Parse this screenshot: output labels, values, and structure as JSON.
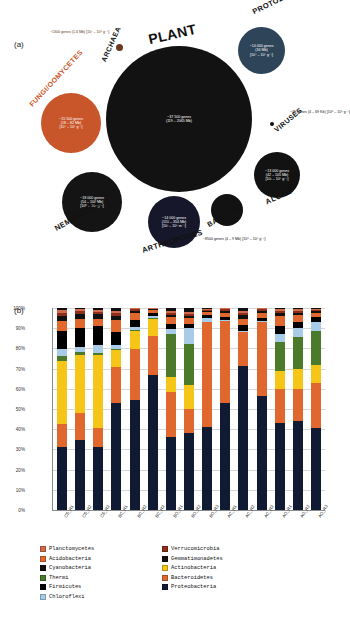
{
  "figure": {
    "panel_a_tag": "(a)",
    "panel_b_tag": "(b)"
  },
  "panel_a": {
    "groups": [
      {
        "name": "plant",
        "label": "PLANT",
        "genes": "~37 500 genes",
        "size": "(119 – 2065 Mb)",
        "abundance": "",
        "color": "#121212",
        "label_color": "#111111"
      },
      {
        "name": "fungi",
        "label": "FUNGI/OOMYCETES",
        "genes": "~15 500 genes",
        "size": "(18 – 82 Mb)",
        "abundance": "[10⁴ – 10⁶ g⁻¹]",
        "color": "#c9562a",
        "label_color": "#c9562a"
      },
      {
        "name": "protozoa",
        "label": "PROTOZOA",
        "genes": "~14 000 genes",
        "size": "(34 Mb)",
        "abundance": "[10⁴ – 10⁵ g⁻¹]",
        "color": "#2e4559",
        "label_color": "#111111"
      },
      {
        "name": "algae",
        "label": "ALGAE",
        "genes": "~13 000 genes",
        "size": "(42 – 105 Mb)",
        "abundance": "[10³ – 10⁶ g⁻¹]",
        "color": "#121212",
        "label_color": "#111111"
      },
      {
        "name": "nematodes",
        "label": "NEMATODES",
        "genes": "~18 000 genes",
        "size": "(54 – 100 Mb)",
        "abundance": "[10⁰ – 10² g⁻¹]",
        "color": "#141414",
        "label_color": "#111111"
      },
      {
        "name": "arthropodes",
        "label": "ARTHROPODES",
        "genes": "~14 000 genes",
        "size": "(151 – 354 Mb)",
        "abundance": "[10² – 10⁵ m⁻²]",
        "color": "#17172b",
        "label_color": "#111111"
      },
      {
        "name": "bacteria",
        "label": "BACTERIA",
        "genes": "~8500 genes",
        "size": "(4 – 9 Mb)",
        "abundance": "[10⁸ – 10⁹ g⁻¹]",
        "color": "#121212",
        "label_color": "#111111"
      },
      {
        "name": "archaea",
        "label": "ARCHAEA",
        "genes": "~1300 genes",
        "size": "(1.6 Mb)",
        "abundance": "[10⁷ – 10⁸ g⁻¹]",
        "color": "#6a3a1e",
        "label_color": "#111111"
      },
      {
        "name": "viruses",
        "label": "VIRUSES",
        "genes": "~45 genes",
        "size": "(4 – 69 Kb)",
        "abundance": "[10⁸ – 10⁹ g⁻¹]",
        "color": "#0d0d0d",
        "label_color": "#111111"
      }
    ]
  },
  "chart_data": {
    "type": "bar",
    "subtype": "stacked-percentage-column",
    "title": "",
    "xlabel": "",
    "ylabel": "Sequences",
    "ylim": [
      0,
      100
    ],
    "ytick_labels": [
      "0%",
      "10%",
      "20%",
      "30%",
      "40%",
      "50%",
      "60%",
      "70%",
      "80%",
      "90%",
      "100%"
    ],
    "grid": true,
    "legend_position": "bottom",
    "categories": [
      "CS_R1",
      "CS_R2",
      "CS_R3",
      "BC_R1",
      "BC_R2",
      "BC_R3",
      "BO_R1",
      "BO_R2",
      "BO_R3",
      "AC_R1",
      "AC_R2",
      "AC_R3",
      "AO_R1",
      "AO_R2",
      "AO_R3"
    ],
    "series": [
      {
        "name": "Proteobacteria",
        "color": "#111a33",
        "values": [
          31,
          34.5,
          31,
          53,
          54.5,
          67,
          36,
          38,
          41,
          53,
          71.5,
          56.5,
          43,
          44,
          41
        ]
      },
      {
        "name": "Bacteroidetes",
        "color": "#e0682f",
        "values": [
          11.5,
          13.5,
          9.5,
          18,
          25,
          19,
          22.5,
          12,
          52,
          40.5,
          16.5,
          36.5,
          17,
          16,
          22
        ]
      },
      {
        "name": "Actinobacteria",
        "color": "#f5c518",
        "values": [
          31.5,
          28.5,
          36,
          8,
          9,
          8.5,
          7.5,
          12,
          0,
          0,
          0,
          0,
          9,
          10,
          9
        ]
      },
      {
        "name": "Thermi",
        "color": "#4a7a2a",
        "values": [
          2.5,
          1.5,
          1,
          0.5,
          0.5,
          0.5,
          21,
          20,
          0,
          0,
          0,
          0,
          14,
          15.5,
          17
        ]
      },
      {
        "name": "Chloroflexi",
        "color": "#a8cbe8",
        "values": [
          3,
          2.5,
          4,
          2,
          1.5,
          1,
          2.5,
          8,
          2,
          0.5,
          0.5,
          0.5,
          4,
          4.5,
          4.5
        ]
      },
      {
        "name": "Firmicutes",
        "color": "#000000",
        "values": [
          9,
          9.5,
          9.5,
          6.5,
          3.5,
          1.5,
          2.5,
          2,
          1.5,
          1.5,
          3,
          1.5,
          4,
          3,
          2.5
        ]
      },
      {
        "name": "Acidobacteria",
        "color": "#e0682f",
        "values": [
          5,
          4.5,
          3.5,
          6,
          3.5,
          1.5,
          3.5,
          3,
          1.5,
          2,
          3,
          2.5,
          5,
          3.5,
          2
        ]
      },
      {
        "name": "Gemmatimonadetes",
        "color": "#111111",
        "values": [
          2.5,
          2.5,
          2.5,
          2,
          1,
          0.5,
          1,
          1,
          0.5,
          1,
          2,
          1,
          1.5,
          1,
          0.8
        ]
      },
      {
        "name": "Verrucomicrobia",
        "color": "#8c2f1c",
        "values": [
          1.5,
          1.5,
          1.0,
          1.5,
          0.8,
          0.3,
          1.0,
          1.0,
          0.5,
          0.8,
          1.0,
          0.8,
          1.0,
          1.0,
          0.7
        ]
      },
      {
        "name": "Planctomycetes",
        "color": "#d16a4a",
        "values": [
          1.5,
          1.0,
          0.8,
          1.3,
          0.5,
          0.2,
          1.0,
          1.2,
          0.5,
          0.5,
          1.0,
          0.5,
          1.0,
          1.0,
          0.5
        ]
      },
      {
        "name": "Cyanobacteria",
        "color": "#101010",
        "values": [
          1.0,
          0.5,
          1.2,
          1.2,
          0.2,
          0.0,
          1.5,
          1.8,
          0.5,
          0.2,
          1.5,
          0.2,
          0.5,
          0.5,
          0.5
        ]
      }
    ]
  },
  "legend": {
    "column_1": [
      {
        "label": "Planctomycetes",
        "color": "#d16a4a"
      },
      {
        "label": "Acidobacteria",
        "color": "#e0682f"
      },
      {
        "label": "Cyanobacteria",
        "color": "#101010"
      },
      {
        "label": "Thermi",
        "color": "#4a7a2a"
      },
      {
        "label": "Firmicutes",
        "color": "#000000"
      },
      {
        "label": "Chloroflexi",
        "color": "#a8cbe8"
      }
    ],
    "column_2": [
      {
        "label": "Verrucomicrobia",
        "color": "#8c2f1c"
      },
      {
        "label": "Gemmatimonadetes",
        "color": "#111111"
      },
      {
        "label": "Actinobacteria",
        "color": "#f5c518"
      },
      {
        "label": "Bacteroidetes",
        "color": "#e0682f"
      },
      {
        "label": "Proteobacteria",
        "color": "#111a33"
      }
    ]
  }
}
